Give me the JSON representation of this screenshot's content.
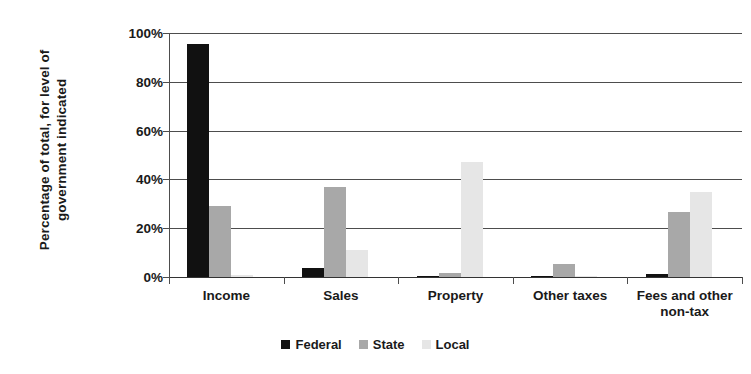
{
  "chart_data": {
    "type": "bar",
    "title": "",
    "xlabel": "",
    "ylabel": "Percentage of total, for level of government indicated",
    "ylabel_line1": "Percentage of total, for level of",
    "ylabel_line2": "government indicated",
    "categories": [
      "Income",
      "Sales",
      "Property",
      "Other taxes",
      "Fees and other non-tax"
    ],
    "category_labels": [
      {
        "line1": "Income",
        "line2": ""
      },
      {
        "line1": "Sales",
        "line2": ""
      },
      {
        "line1": "Property",
        "line2": ""
      },
      {
        "line1": "Other taxes",
        "line2": ""
      },
      {
        "line1": "Fees and other",
        "line2": "non-tax"
      }
    ],
    "series": [
      {
        "name": "Federal",
        "color": "#111111",
        "values": [
          95.5,
          3.5,
          0.5,
          0.3,
          1.3
        ]
      },
      {
        "name": "State",
        "color": "#a8a8a8",
        "values": [
          29.0,
          36.8,
          1.5,
          5.5,
          26.8
        ]
      },
      {
        "name": "Local",
        "color": "#e6e6e6",
        "values": [
          1.0,
          11.0,
          47.2,
          0.4,
          35.0
        ]
      }
    ],
    "ylim": [
      0,
      100
    ],
    "yticks": [
      0,
      20,
      40,
      60,
      80,
      100
    ],
    "ytick_labels": [
      "0%",
      "20%",
      "40%",
      "60%",
      "80%",
      "100%"
    ],
    "grid": true,
    "grid_axis": "y",
    "legend_position": "bottom",
    "legend_entries": [
      "Federal",
      "State",
      "Local"
    ],
    "value_unit": "percent"
  }
}
